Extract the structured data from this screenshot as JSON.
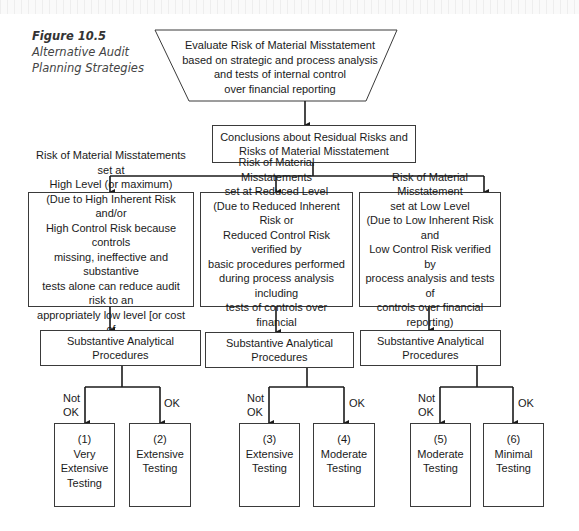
{
  "caption": {
    "figure_number": "Figure 10.5",
    "title": "Alternative Audit Planning Strategies"
  },
  "start": {
    "text": "Evaluate Risk of Material Misstatement\nbased on strategic and process analysis\nand tests of internal control\nover financial reporting"
  },
  "conclusions": {
    "text": "Conclusions about Residual Risks and\nRisks of Material Misstatement"
  },
  "risk_levels": [
    {
      "text": "Risk of Material Misstatements set at\nHigh Level (or maximum)\n(Due to High Inherent Risk and/or\nHigh Control Risk because controls\nmissing, ineffective and substantive\ntests alone can reduce audit risk to an\nappropriately low level [or cost of\ntesting deemed excessive])"
    },
    {
      "text": "Risk of Material Misstatements\nset at Reduced Level\n(Due to Reduced Inherent Risk or\nReduced Control Risk verified by\nbasic procedures performed\nduring process analysis including\ntests of controls over financial\nreporting)"
    },
    {
      "text": "Risk of Material Misstatement\nset at Low Level\n(Due to Low Inherent Risk and\nLow Control Risk verified by\nprocess analysis and tests of\ncontrols over financial\nreporting)"
    }
  ],
  "analytical": [
    {
      "text": "Substantive Analytical\nProcedures"
    },
    {
      "text": "Substantive Analytical\nProcedures"
    },
    {
      "text": "Substantive Analytical\nProcedures"
    }
  ],
  "branch_labels": {
    "not_ok": "Not\nOK",
    "ok": "OK"
  },
  "outcomes": [
    {
      "text": "(1)\nVery\nExtensive\nTesting"
    },
    {
      "text": "(2)\nExtensive\nTesting"
    },
    {
      "text": "(3)\nExtensive\nTesting"
    },
    {
      "text": "(4)\nModerate\nTesting"
    },
    {
      "text": "(5)\nModerate\nTesting"
    },
    {
      "text": "(6)\nMinimal\nTesting"
    }
  ]
}
